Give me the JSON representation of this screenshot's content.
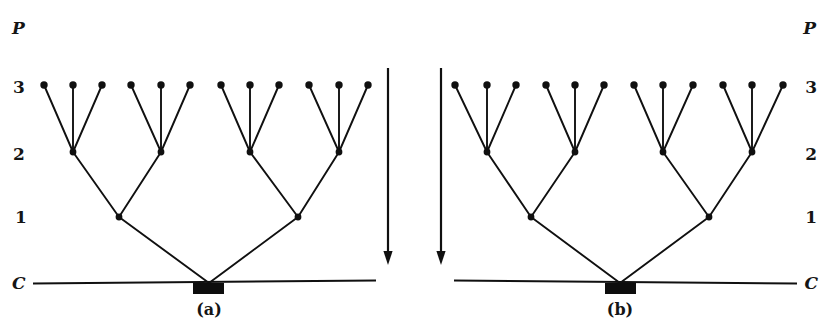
{
  "figure": {
    "background_color": "#ffffff",
    "ink_color": "#101010",
    "width": 829,
    "height": 331
  },
  "axis": {
    "top_symbol": "P",
    "bottom_symbol": "C",
    "level_labels": [
      "3",
      "2",
      "1"
    ],
    "left_axis": {
      "P": {
        "x": 18,
        "y": 27
      },
      "3": {
        "x": 18,
        "y": 86
      },
      "2": {
        "x": 18,
        "y": 153
      },
      "1": {
        "x": 18,
        "y": 216
      },
      "C": {
        "x": 18,
        "y": 283
      }
    },
    "right_axis": {
      "P": {
        "x": 812,
        "y": 27
      },
      "3": {
        "x": 812,
        "y": 86
      },
      "2": {
        "x": 812,
        "y": 153
      },
      "1": {
        "x": 812,
        "y": 216
      },
      "C": {
        "x": 812,
        "y": 283
      }
    }
  },
  "rows": {
    "P": 27,
    "level3": 85,
    "level2": 152,
    "level1": 217,
    "C": 282
  },
  "arrows": [
    {
      "name": "time-arrow-left",
      "x": 388,
      "y_start": 68,
      "y_end": 265,
      "direction": "down"
    },
    {
      "name": "time-arrow-right",
      "x": 441,
      "y_start": 68,
      "y_end": 265,
      "direction": "down"
    }
  ],
  "panels": [
    {
      "id": "a",
      "caption": "(a)",
      "caption_x": 209,
      "caption_y": 315,
      "baseline": {
        "x1": 33,
        "x2": 376,
        "y": 282,
        "tilt": -3
      },
      "root_box": {
        "x": 193,
        "y": 283,
        "width": 31,
        "height": 11
      },
      "root": {
        "x": 209,
        "y": 283
      },
      "level1_nodes": [
        {
          "x": 119,
          "y": 217
        },
        {
          "x": 298,
          "y": 217
        }
      ],
      "level2_nodes": [
        {
          "x": 73,
          "y": 152
        },
        {
          "x": 161,
          "y": 152
        },
        {
          "x": 250,
          "y": 152
        },
        {
          "x": 339,
          "y": 152
        }
      ],
      "level3_nodes": [
        {
          "x": 44,
          "y": 85
        },
        {
          "x": 73,
          "y": 85
        },
        {
          "x": 102,
          "y": 85
        },
        {
          "x": 131,
          "y": 85
        },
        {
          "x": 161,
          "y": 85
        },
        {
          "x": 190,
          "y": 85
        },
        {
          "x": 221,
          "y": 85
        },
        {
          "x": 250,
          "y": 85
        },
        {
          "x": 279,
          "y": 85
        },
        {
          "x": 309,
          "y": 85
        },
        {
          "x": 339,
          "y": 85
        },
        {
          "x": 368,
          "y": 85
        }
      ],
      "edges_root_to_level1": [
        [
          209,
          283,
          119,
          217
        ],
        [
          209,
          283,
          298,
          217
        ]
      ],
      "edges_level1_to_level2": [
        [
          119,
          217,
          73,
          152
        ],
        [
          119,
          217,
          161,
          152
        ],
        [
          298,
          217,
          250,
          152
        ],
        [
          298,
          217,
          339,
          152
        ]
      ],
      "edges_level2_to_level3": [
        [
          73,
          152,
          44,
          85
        ],
        [
          73,
          152,
          73,
          85
        ],
        [
          73,
          152,
          102,
          85
        ],
        [
          161,
          152,
          131,
          85
        ],
        [
          161,
          152,
          161,
          85
        ],
        [
          161,
          152,
          190,
          85
        ],
        [
          250,
          152,
          221,
          85
        ],
        [
          250,
          152,
          250,
          85
        ],
        [
          250,
          152,
          279,
          85
        ],
        [
          339,
          152,
          309,
          85
        ],
        [
          339,
          152,
          339,
          85
        ],
        [
          339,
          152,
          368,
          85
        ]
      ]
    },
    {
      "id": "b",
      "caption": "(b)",
      "caption_x": 620,
      "caption_y": 315,
      "baseline": {
        "x1": 454,
        "x2": 797,
        "y": 282,
        "tilt": 3
      },
      "root_box": {
        "x": 605,
        "y": 283,
        "width": 31,
        "height": 11
      },
      "root": {
        "x": 620,
        "y": 283
      },
      "level1_nodes": [
        {
          "x": 531,
          "y": 217
        },
        {
          "x": 709,
          "y": 217
        }
      ],
      "level2_nodes": [
        {
          "x": 487,
          "y": 152
        },
        {
          "x": 575,
          "y": 152
        },
        {
          "x": 663,
          "y": 152
        },
        {
          "x": 752,
          "y": 152
        }
      ],
      "level3_nodes": [
        {
          "x": 455,
          "y": 85
        },
        {
          "x": 487,
          "y": 85
        },
        {
          "x": 516,
          "y": 85
        },
        {
          "x": 546,
          "y": 85
        },
        {
          "x": 575,
          "y": 85
        },
        {
          "x": 604,
          "y": 85
        },
        {
          "x": 634,
          "y": 85
        },
        {
          "x": 663,
          "y": 85
        },
        {
          "x": 693,
          "y": 85
        },
        {
          "x": 723,
          "y": 85
        },
        {
          "x": 752,
          "y": 85
        },
        {
          "x": 783,
          "y": 85
        }
      ],
      "edges_root_to_level1": [
        [
          620,
          283,
          531,
          217
        ],
        [
          620,
          283,
          709,
          217
        ]
      ],
      "edges_level1_to_level2": [
        [
          531,
          217,
          487,
          152
        ],
        [
          531,
          217,
          575,
          152
        ],
        [
          709,
          217,
          663,
          152
        ],
        [
          709,
          217,
          752,
          152
        ]
      ],
      "edges_level2_to_level3": [
        [
          487,
          152,
          455,
          85
        ],
        [
          487,
          152,
          487,
          85
        ],
        [
          487,
          152,
          516,
          85
        ],
        [
          575,
          152,
          546,
          85
        ],
        [
          575,
          152,
          575,
          85
        ],
        [
          575,
          152,
          604,
          85
        ],
        [
          663,
          152,
          634,
          85
        ],
        [
          663,
          152,
          663,
          85
        ],
        [
          663,
          152,
          693,
          85
        ],
        [
          752,
          152,
          723,
          85
        ],
        [
          752,
          152,
          752,
          85
        ],
        [
          752,
          152,
          783,
          85
        ]
      ]
    }
  ],
  "node_radius": 3.4
}
